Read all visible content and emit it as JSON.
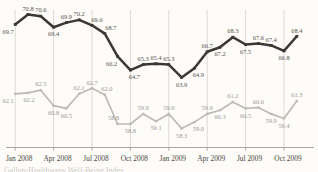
{
  "chart_data": {
    "type": "line",
    "title": "",
    "xlabel": "",
    "ylabel": "",
    "legend": "none",
    "grid": "vertical-quarterly-gridlines",
    "ylim": [
      57.5,
      71.5
    ],
    "n_points": 23,
    "x_tick_labels": [
      "Jan 2008",
      "Apr 2008",
      "Jul 2008",
      "Oct 2008",
      "Jan 2009",
      "Apr 2009",
      "Jul 2009",
      "Oct 2009"
    ],
    "x_tick_indices": [
      0,
      3,
      6,
      9,
      12,
      15,
      18,
      21
    ],
    "series": [
      {
        "name": "upper-dark-series",
        "color": "#3b3834",
        "label_color": "#55514b",
        "marker": "square",
        "values": [
          69.7,
          70.8,
          70.6,
          69.4,
          69.9,
          70.2,
          69.6,
          68.7,
          66.2,
          64.7,
          65.3,
          65.4,
          65.3,
          63.9,
          64.9,
          66.7,
          67.2,
          68.3,
          67.5,
          67.6,
          67.4,
          66.8,
          68.4
        ],
        "label_side": [
          "B",
          "A",
          "A",
          "B",
          "A",
          "A",
          "A",
          "A",
          "B",
          "B",
          "A",
          "A",
          "A",
          "B",
          "B",
          "A",
          "B",
          "A",
          "B",
          "A",
          "A",
          "B",
          "A"
        ],
        "label_dx": [
          -7,
          0,
          0,
          0,
          0,
          0,
          5,
          6,
          -6,
          4,
          0,
          0,
          0,
          0,
          4,
          0,
          0,
          0,
          0,
          0,
          0,
          0,
          0
        ]
      },
      {
        "name": "lower-gray-series",
        "color": "#bdbab4",
        "label_color": "#9c9892",
        "marker": "square",
        "values": [
          62.1,
          62.2,
          62.5,
          60.8,
          60.5,
          62.1,
          62.7,
          62.0,
          58.8,
          58.8,
          59.9,
          59.1,
          59.9,
          58.3,
          59.0,
          59.9,
          60.3,
          61.2,
          60.5,
          60.6,
          59.9,
          59.4,
          61.3
        ],
        "label_side": [
          "B",
          "B",
          "A",
          "B",
          "B",
          "A",
          "A",
          "A",
          "A",
          "B",
          "A",
          "B",
          "A",
          "B",
          "B",
          "A",
          "B",
          "A",
          "B",
          "A",
          "B",
          "B",
          "A"
        ],
        "label_dx": [
          -7,
          1,
          0,
          0,
          0,
          0,
          0,
          2,
          -4,
          0,
          0,
          0,
          0,
          0,
          4,
          0,
          0,
          0,
          0,
          0,
          0,
          0,
          0
        ]
      }
    ],
    "colors": {
      "background": "#fdfcf9",
      "gridline": "#ded9d2",
      "axis_line": "#a9a49d",
      "axis_label": "#4c4741"
    }
  },
  "footer_caption": {
    "label": "Gallup-Healthways Well-Being Index"
  }
}
